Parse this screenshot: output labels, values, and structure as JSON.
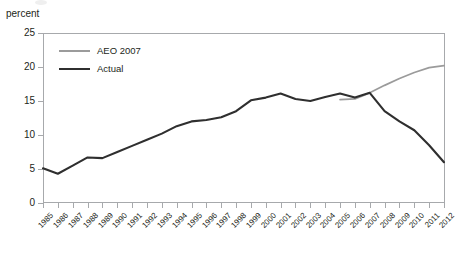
{
  "figure": {
    "y_axis_caption": "percent"
  },
  "legend": {
    "position": "top-left-inside",
    "entries": [
      {
        "label": "AEO 2007",
        "color": "#9b9b9b",
        "name": "legend-item-aeo-2007"
      },
      {
        "label": "Actual",
        "color": "#2f2f2f",
        "name": "legend-item-actual"
      }
    ]
  },
  "chart_data": {
    "type": "line",
    "title": "",
    "subtitle": "",
    "xlabel": "",
    "ylabel": "percent",
    "ylim": [
      0,
      25
    ],
    "yticks": [
      0,
      5,
      10,
      15,
      20,
      25
    ],
    "ytick_labels": [
      "0",
      "5",
      "10",
      "15",
      "20",
      "25"
    ],
    "grid": false,
    "legend_position": "upper left",
    "x": [
      "1985",
      "1986",
      "1987",
      "1988",
      "1989",
      "1990",
      "1991",
      "1992",
      "1993",
      "1994",
      "1995",
      "1996",
      "1997",
      "1998",
      "1999",
      "2000",
      "2001",
      "2002",
      "2003",
      "2004",
      "2005",
      "2006",
      "2007",
      "2008",
      "2009",
      "2010",
      "2011",
      "2012"
    ],
    "series": [
      {
        "name": "AEO 2007",
        "color": "#9b9b9b",
        "x": [
          "2005",
          "2006",
          "2007",
          "2008",
          "2009",
          "2010",
          "2011",
          "2012"
        ],
        "values": [
          15.2,
          15.3,
          16.2,
          17.3,
          18.3,
          19.2,
          19.9,
          20.2
        ]
      },
      {
        "name": "Actual",
        "color": "#2f2f2f",
        "x": [
          "1985",
          "1986",
          "1987",
          "1988",
          "1989",
          "1990",
          "1991",
          "1992",
          "1993",
          "1994",
          "1995",
          "1996",
          "1997",
          "1998",
          "1999",
          "2000",
          "2001",
          "2002",
          "2003",
          "2004",
          "2005",
          "2006",
          "2007",
          "2008",
          "2009",
          "2010",
          "2011",
          "2012"
        ],
        "values": [
          5.1,
          4.3,
          5.5,
          6.7,
          6.6,
          7.5,
          8.4,
          9.3,
          10.2,
          11.3,
          12.0,
          12.2,
          12.6,
          13.5,
          15.1,
          15.5,
          16.1,
          15.3,
          15.0,
          15.6,
          16.1,
          15.5,
          16.2,
          13.5,
          12.0,
          10.7,
          8.5,
          6.0
        ]
      }
    ]
  }
}
